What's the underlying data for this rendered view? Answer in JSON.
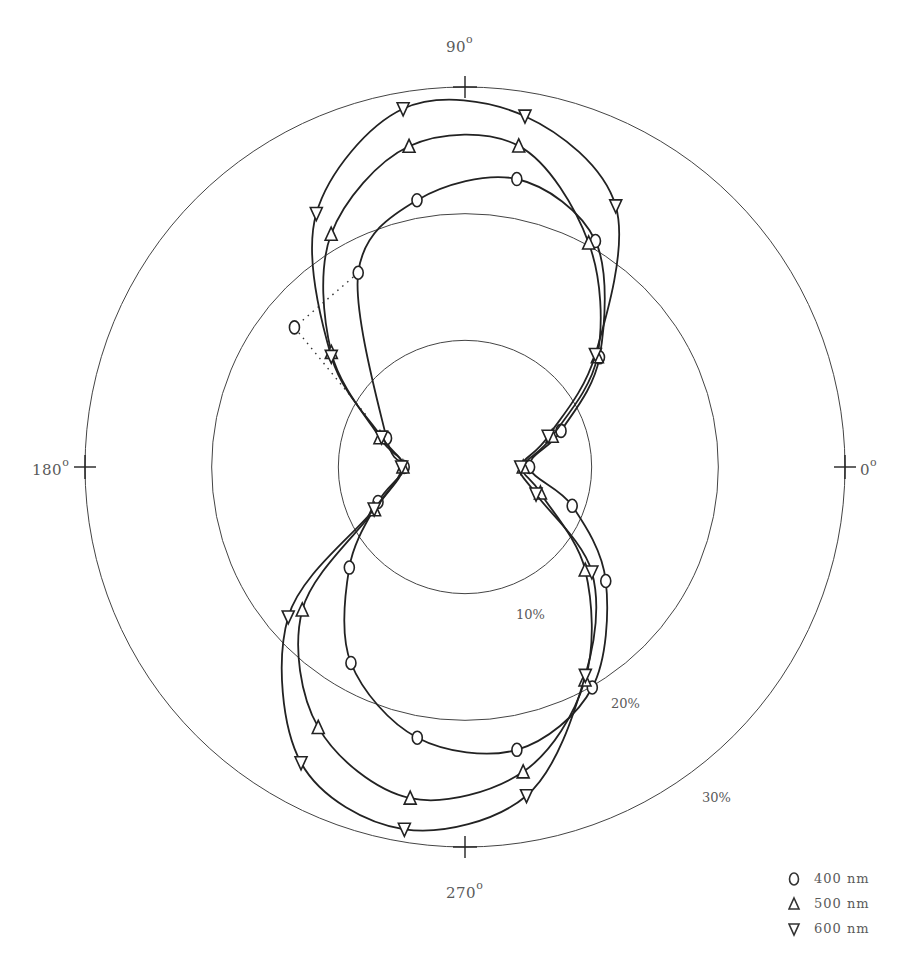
{
  "chart_data": {
    "type": "polar-line",
    "title": "",
    "angular_axis": {
      "unit": "degrees",
      "ticks": [
        0,
        90,
        180,
        270
      ],
      "tick_labels": {
        "t0": "0",
        "t90": "90",
        "t180": "180",
        "t270": "270"
      },
      "degree_symbol": "o"
    },
    "radial_axis": {
      "unit": "%",
      "rings": [
        10,
        20,
        30
      ],
      "ring_labels": [
        "10%",
        "20%",
        "30%"
      ],
      "range": [
        0,
        30
      ]
    },
    "legend_position": "bottom-right",
    "series": [
      {
        "name": "400 nm",
        "marker": "circle",
        "points": [
          [
            0,
            5.1
          ],
          [
            20.6,
            8.1
          ],
          [
            39.2,
            13.7
          ],
          [
            60,
            20.6
          ],
          [
            79.8,
            23.1
          ],
          [
            100.2,
            21.4
          ],
          [
            118.8,
            17.5
          ],
          [
            159.8,
            6.6
          ],
          [
            180,
            4.8
          ],
          [
            201.9,
            7.4
          ],
          [
            221,
            12.1
          ],
          [
            239.8,
            17.9
          ],
          [
            260,
            21.7
          ],
          [
            280.4,
            22.7
          ],
          [
            300,
            20.1
          ],
          [
            321,
            14.3
          ],
          [
            340.1,
            9.0
          ],
          [
            360,
            5.1
          ]
        ],
        "outlier": {
          "angle": 140.7,
          "value": 17.4,
          "connector": "dotted"
        }
      },
      {
        "name": "500 nm",
        "marker": "triangle-up",
        "points": [
          [
            0,
            4.6
          ],
          [
            19.4,
            7.3
          ],
          [
            39.8,
            13.6
          ],
          [
            61.1,
            20.2
          ],
          [
            80.5,
            25.7
          ],
          [
            99.9,
            25.7
          ],
          [
            119.9,
            21.2
          ],
          [
            139.4,
            13.9
          ],
          [
            161,
            7.1
          ],
          [
            180,
            4.9
          ],
          [
            205.3,
            7.9
          ],
          [
            221.3,
            17.1
          ],
          [
            240.6,
            23.6
          ],
          [
            260.6,
            26.5
          ],
          [
            280.8,
            24.5
          ],
          [
            299.4,
            19.3
          ],
          [
            319.4,
            12.5
          ],
          [
            341,
            6.3
          ],
          [
            360,
            4.6
          ]
        ]
      },
      {
        "name": "600 nm",
        "marker": "triangle-down",
        "points": [
          [
            0,
            4.4
          ],
          [
            20.3,
            7.0
          ],
          [
            40.8,
            13.6
          ],
          [
            60,
            23.8
          ],
          [
            80.3,
            28.1
          ],
          [
            99.8,
            28.7
          ],
          [
            120.4,
            23.2
          ],
          [
            140.4,
            13.7
          ],
          [
            160.3,
            7.0
          ],
          [
            180,
            5.0
          ],
          [
            204.8,
            7.9
          ],
          [
            220.3,
            18.3
          ],
          [
            241,
            26.7
          ],
          [
            260.5,
            29.0
          ],
          [
            280.6,
            26.4
          ],
          [
            300,
            19.0
          ],
          [
            320.4,
            13.0
          ],
          [
            339.2,
            6.0
          ],
          [
            360,
            4.4
          ]
        ]
      }
    ]
  },
  "labels": {
    "deg90": "90",
    "deg180": "180",
    "deg0": "0",
    "deg270": "270",
    "degsym": "o",
    "ring10": "10%",
    "ring20": "20%",
    "ring30": "30%"
  },
  "legend": {
    "items": [
      {
        "symbol": "circle",
        "label": "400 nm"
      },
      {
        "symbol": "triangle-up",
        "label": "500 nm"
      },
      {
        "symbol": "triangle-down",
        "label": "600 nm"
      }
    ]
  }
}
